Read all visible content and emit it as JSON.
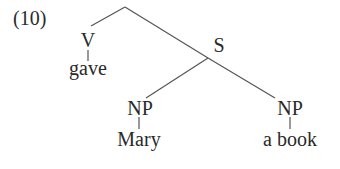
{
  "example_number": "(10)",
  "tree": {
    "nodes": {
      "v": "V",
      "s": "S",
      "np_left": "NP",
      "np_right": "NP"
    },
    "leaves": {
      "v": "gave",
      "np_left": "Mary",
      "np_right": "a book"
    }
  }
}
